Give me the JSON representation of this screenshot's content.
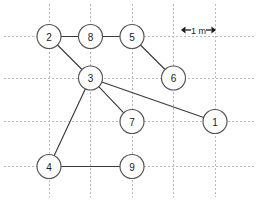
{
  "figure": {
    "type": "node-link-diagram",
    "width": 258,
    "height": 201,
    "background_color": "#ffffff"
  },
  "scale_bar": {
    "label": "1 m",
    "left_arrow_icon": "arrow-left-icon",
    "right_arrow_icon": "arrow-right-icon",
    "x_start": 181,
    "x_end": 216,
    "y": 30,
    "color": "#1a1a1a"
  },
  "grid": {
    "visible": true,
    "style": "dotted",
    "color": "#b9b9b9",
    "spacing_px": 41.5,
    "spacing_meters": 1,
    "vertical_x": [
      49,
      90.5,
      132,
      173.5,
      215
    ],
    "horizontal_y": [
      36.5,
      78,
      121.5,
      166.5
    ]
  },
  "nodes": [
    {
      "id": "1",
      "label": "1",
      "x": 215,
      "y": 121.5,
      "r": 12
    },
    {
      "id": "2",
      "label": "2",
      "x": 49,
      "y": 36.5,
      "r": 12
    },
    {
      "id": "3",
      "label": "3",
      "x": 90.5,
      "y": 78,
      "r": 12
    },
    {
      "id": "4",
      "label": "4",
      "x": 49,
      "y": 166.5,
      "r": 12
    },
    {
      "id": "5",
      "label": "5",
      "x": 132,
      "y": 36.5,
      "r": 12
    },
    {
      "id": "6",
      "label": "6",
      "x": 173.5,
      "y": 78,
      "r": 12
    },
    {
      "id": "7",
      "label": "7",
      "x": 132,
      "y": 121.5,
      "r": 12
    },
    {
      "id": "8",
      "label": "8",
      "x": 90.5,
      "y": 36.5,
      "r": 12
    },
    {
      "id": "9",
      "label": "9",
      "x": 132,
      "y": 166.5,
      "r": 12
    }
  ],
  "edges": [
    {
      "from": "2",
      "to": "8"
    },
    {
      "from": "8",
      "to": "5"
    },
    {
      "from": "2",
      "to": "3"
    },
    {
      "from": "5",
      "to": "6"
    },
    {
      "from": "3",
      "to": "1"
    },
    {
      "from": "3",
      "to": "7"
    },
    {
      "from": "3",
      "to": "4"
    },
    {
      "from": "4",
      "to": "9"
    }
  ],
  "colors": {
    "edge": "#3a3a3a",
    "node_stroke": "#555555",
    "node_fill": "#ffffff",
    "grid": "#b9b9b9",
    "text": "#1a1a1a"
  }
}
